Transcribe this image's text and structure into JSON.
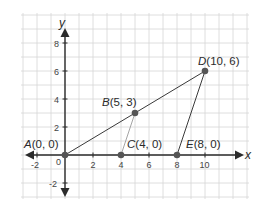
{
  "diagram": {
    "type": "coordinate-plane",
    "axes": {
      "x_label": "x",
      "y_label": "y",
      "x_ticks": [
        "-2",
        "2",
        "4",
        "6",
        "8",
        "10"
      ],
      "y_ticks": [
        "8",
        "6",
        "4",
        "2",
        "-2"
      ],
      "origin_label": "0",
      "x_range": [
        -3,
        13
      ],
      "y_range": [
        -3,
        10
      ]
    },
    "grid": {
      "visible": true,
      "step": 1,
      "color": "#d6d6d6"
    },
    "points": [
      {
        "name": "A",
        "coords": "(0, 0)",
        "x": 0,
        "y": 0
      },
      {
        "name": "B",
        "coords": "(5, 3)",
        "x": 5,
        "y": 3
      },
      {
        "name": "C",
        "coords": "(4, 0)",
        "x": 4,
        "y": 0
      },
      {
        "name": "D",
        "coords": "(10, 6)",
        "x": 10,
        "y": 6
      },
      {
        "name": "E",
        "coords": "(8, 0)",
        "x": 8,
        "y": 0
      }
    ],
    "segments": [
      {
        "from": "A",
        "to": "D",
        "style": "solid-dark"
      },
      {
        "from": "D",
        "to": "E",
        "style": "solid-dark"
      },
      {
        "from": "B",
        "to": "C",
        "style": "solid-light"
      }
    ],
    "colors": {
      "axis": "#2b2b2b",
      "point": "#555555",
      "segment": "#3a3a3a",
      "segment_light": "#9a9a9a"
    }
  }
}
